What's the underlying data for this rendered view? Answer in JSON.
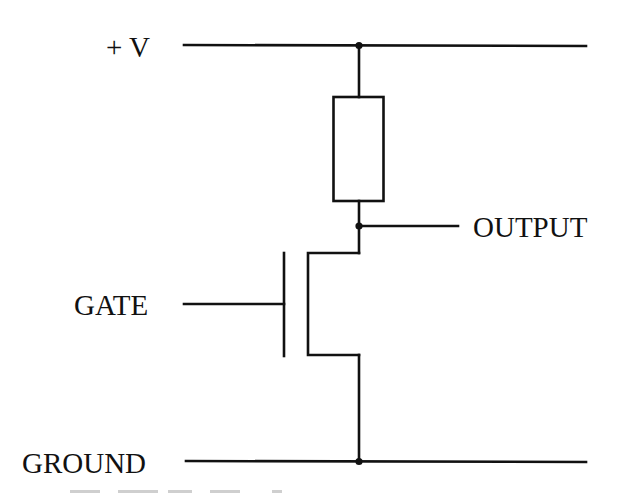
{
  "diagram": {
    "type": "circuit-schematic",
    "colors": {
      "line": "#111111",
      "background": "#ffffff"
    },
    "labels": {
      "supply": "+ V",
      "output": "OUTPUT",
      "gate": "GATE",
      "ground": "GROUND"
    },
    "components": [
      {
        "id": "R1",
        "kind": "resistor",
        "between": [
          "supply",
          "output-node"
        ]
      },
      {
        "id": "Q1",
        "kind": "mosfet",
        "gate": "gate",
        "drain": "output-node",
        "source": "ground"
      }
    ],
    "nodes": [
      "supply-junction",
      "output-node",
      "ground-junction"
    ],
    "caption": {
      "visible": "cropped",
      "text": null
    }
  }
}
